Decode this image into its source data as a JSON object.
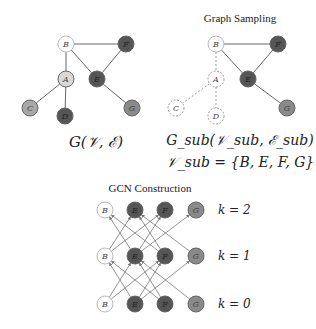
{
  "titles": {
    "sampling": "Graph Sampling",
    "gcn": "GCN Construction"
  },
  "formulas": {
    "full_graph": "G(𝒱, ℰ)",
    "sub_graph": "G_sub(𝒱_sub, ℰ_sub)",
    "sub_vertices": "𝒱_sub = {B, E, F, G}"
  },
  "colors": {
    "white_node": "#ffffff",
    "light_node": "#d0d0d0",
    "medium_node": "#9a9a9a",
    "dark_node": "#555555",
    "edge": "#666666"
  },
  "left_graph": {
    "nodes": [
      {
        "id": "B",
        "x": 66,
        "y": 44,
        "fill": "#ffffff"
      },
      {
        "id": "F",
        "x": 126,
        "y": 44,
        "fill": "#555555"
      },
      {
        "id": "A",
        "x": 66,
        "y": 79,
        "fill": "#d8d8d8"
      },
      {
        "id": "E",
        "x": 97,
        "y": 79,
        "fill": "#555555"
      },
      {
        "id": "C",
        "x": 30,
        "y": 108,
        "fill": "#a8a8a8"
      },
      {
        "id": "D",
        "x": 65,
        "y": 116,
        "fill": "#555555"
      },
      {
        "id": "G",
        "x": 132,
        "y": 108,
        "fill": "#8a8a8a"
      }
    ],
    "edges": [
      [
        "B",
        "F"
      ],
      [
        "B",
        "A"
      ],
      [
        "B",
        "E"
      ],
      [
        "F",
        "E"
      ],
      [
        "A",
        "C"
      ],
      [
        "A",
        "D"
      ],
      [
        "E",
        "G"
      ]
    ]
  },
  "right_graph": {
    "nodes": [
      {
        "id": "B",
        "x": 216,
        "y": 44,
        "fill": "#ffffff",
        "dashed": false
      },
      {
        "id": "F",
        "x": 278,
        "y": 44,
        "fill": "#555555",
        "dashed": false
      },
      {
        "id": "A",
        "x": 216,
        "y": 79,
        "fill": "none",
        "dashed": true
      },
      {
        "id": "E",
        "x": 248,
        "y": 79,
        "fill": "#555555",
        "dashed": false
      },
      {
        "id": "C",
        "x": 176,
        "y": 108,
        "fill": "none",
        "dashed": true
      },
      {
        "id": "D",
        "x": 216,
        "y": 116,
        "fill": "none",
        "dashed": true
      },
      {
        "id": "G",
        "x": 287,
        "y": 108,
        "fill": "#8a8a8a",
        "dashed": false
      }
    ],
    "edges": [
      {
        "a": "B",
        "b": "F",
        "dashed": false
      },
      {
        "a": "B",
        "b": "E",
        "dashed": false
      },
      {
        "a": "F",
        "b": "E",
        "dashed": false
      },
      {
        "a": "E",
        "b": "G",
        "dashed": false
      },
      {
        "a": "B",
        "b": "A",
        "dashed": true
      },
      {
        "a": "A",
        "b": "C",
        "dashed": true
      },
      {
        "a": "A",
        "b": "D",
        "dashed": true
      }
    ]
  },
  "gcn": {
    "columns": [
      {
        "id": "B",
        "x": 105,
        "fill": "#ffffff"
      },
      {
        "id": "E",
        "x": 135,
        "fill": "#555555"
      },
      {
        "id": "F",
        "x": 165,
        "fill": "#555555"
      },
      {
        "id": "G",
        "x": 196,
        "fill": "#8a8a8a"
      }
    ],
    "layers": [
      {
        "label": "k = 2",
        "y": 210
      },
      {
        "label": "k = 1",
        "y": 256
      },
      {
        "label": "k = 0",
        "y": 304
      }
    ],
    "layer_labels": [
      "k = 2",
      "k = 1",
      "k = 0"
    ],
    "neighbors": [
      [
        "B",
        "E"
      ],
      [
        "B",
        "F"
      ],
      [
        "E",
        "B"
      ],
      [
        "E",
        "F"
      ],
      [
        "E",
        "G"
      ],
      [
        "F",
        "B"
      ],
      [
        "F",
        "E"
      ],
      [
        "G",
        "E"
      ]
    ]
  }
}
